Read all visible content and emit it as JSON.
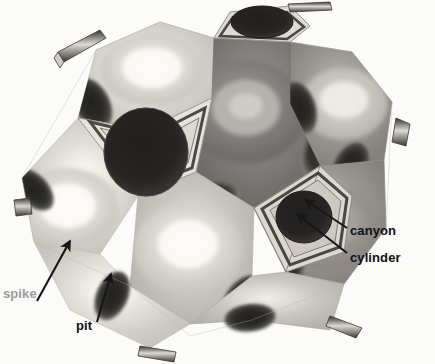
{
  "figure": {
    "background_color": "#fbfbfa",
    "width": 435,
    "height": 364,
    "shape": "truncated icosahedron ball with displaced faces",
    "palette": {
      "face_light": "#e9e7e2",
      "face_mid": "#c9c6c0",
      "face_dark": "#8e8c88",
      "face_darkest": "#6f6d6a",
      "pit_dark": "#2b2a28",
      "rim_light": "#f2f1ec",
      "outline": "#4a4946",
      "arrow_color": "#16161a",
      "label_dark": "#101014",
      "label_gray": "#9a9a9a"
    }
  },
  "annotations": [
    {
      "id": "canyon",
      "label": "canyon",
      "color": "#101014",
      "label_x": 350,
      "label_y": 231,
      "font_size": 13,
      "arrow": {
        "x1": 347,
        "y1": 228,
        "x2": 305,
        "y2": 200
      }
    },
    {
      "id": "cylinder",
      "label": "cylinder",
      "color": "#101014",
      "label_x": 350,
      "label_y": 258,
      "font_size": 13,
      "arrow": {
        "x1": 347,
        "y1": 253,
        "x2": 297,
        "y2": 214
      }
    },
    {
      "id": "spike",
      "label": "spike",
      "color": "#9a9a9a",
      "label_x": 3,
      "label_y": 294,
      "font_size": 13,
      "arrow": {
        "x1": 37,
        "y1": 301,
        "x2": 70,
        "y2": 241
      }
    },
    {
      "id": "pit",
      "label": "pit",
      "color": "#101014",
      "label_x": 76,
      "label_y": 326,
      "font_size": 13,
      "arrow": {
        "x1": 97,
        "y1": 322,
        "x2": 111,
        "y2": 274
      }
    }
  ],
  "features": {
    "spike_description": "light radial bump at face center",
    "pit_description": "dark elliptical depression",
    "canyon_description": "recessed groove around pentagon rim",
    "cylinder_description": "circular cylindrical hole in pentagon face"
  }
}
